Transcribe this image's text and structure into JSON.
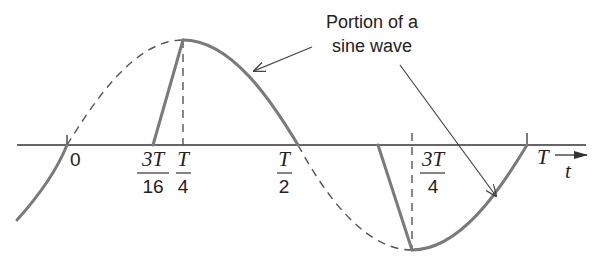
{
  "diagram": {
    "title": "",
    "callout": {
      "line1": "Portion of a",
      "line2": "sine wave"
    },
    "axis": {
      "variable": "t"
    },
    "ticks": [
      {
        "id": "zero",
        "label": "0"
      },
      {
        "id": "three_t_16",
        "numerator": "3T",
        "denominator": "16"
      },
      {
        "id": "t_4",
        "numerator": "T",
        "denominator": "4"
      },
      {
        "id": "t_2",
        "numerator": "T",
        "denominator": "2"
      },
      {
        "id": "three_t_4",
        "numerator": "3T",
        "denominator": "4"
      },
      {
        "id": "t_full",
        "label": "T"
      }
    ],
    "colors": {
      "curve": "#7a7a7a",
      "axis": "#333333",
      "dashed": "#555555"
    }
  }
}
